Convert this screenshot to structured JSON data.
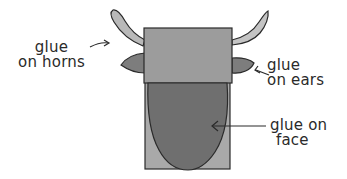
{
  "diagram": {
    "labels": {
      "horns": {
        "line1": "glue",
        "line2": "on horns"
      },
      "ears": {
        "line1": "glue",
        "line2": "on ears"
      },
      "face": {
        "line1": "glue on",
        "line2": "face"
      }
    },
    "colors": {
      "outline": "#2a2a2a",
      "horn_fill": "#b9b9b9",
      "ear_fill": "#7d7d7d",
      "top_block_fill": "#9c9c9c",
      "back_panel_fill": "#a9a9a9",
      "face_fill": "#6f6f6f",
      "background": "#ffffff"
    }
  }
}
